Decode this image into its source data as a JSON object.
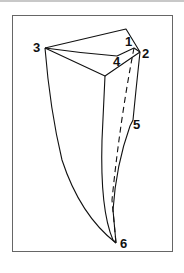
{
  "diagram": {
    "type": "crystal-shape-sketch",
    "labels": {
      "p1": "1",
      "p2": "2",
      "p3": "3",
      "p4": "4",
      "p5": "5",
      "p6": "6"
    },
    "stroke_color": "#111111",
    "frame_color": "#666666"
  }
}
